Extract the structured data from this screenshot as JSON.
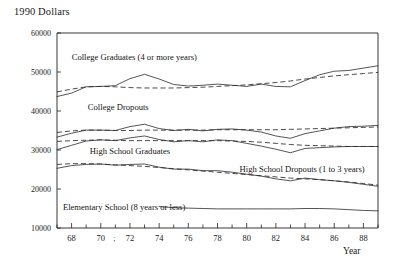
{
  "chart_data": {
    "type": "line",
    "title": "1990 Dollars",
    "xlabel": "Year",
    "ylabel": "",
    "xlim": [
      67,
      89
    ],
    "ylim": [
      10000,
      60000
    ],
    "grid": false,
    "legend_position": "inline-annotations",
    "ytick_labels": [
      "60000",
      "50000",
      "40000",
      "30000",
      "20000",
      "10000"
    ],
    "ytick_values": [
      60000,
      50000,
      40000,
      30000,
      20000,
      10000
    ],
    "xtick_labels": [
      "68",
      "70",
      "72",
      "74",
      "76",
      "78",
      "80",
      "82",
      "84",
      "86",
      "88"
    ],
    "xtick_values": [
      68,
      70,
      72,
      74,
      76,
      78,
      80,
      82,
      84,
      86,
      88
    ],
    "x_minor_ticks": [
      67,
      69,
      71,
      73,
      75,
      77,
      79,
      81,
      83,
      85,
      87,
      89
    ],
    "stray_mark": ";",
    "annotations": [
      {
        "text": "College Graduates (4 or more years)",
        "x": 72.3,
        "y": 53200
      },
      {
        "text": "College Dropouts",
        "x": 71.2,
        "y": 40300
      },
      {
        "text": "High School Graduates",
        "x": 72.0,
        "y": 29100
      },
      {
        "text": "High School Dropouts (1 to 3 years)",
        "x": 83.8,
        "y": 24300
      },
      {
        "text": "Elementary School (8 years or less)",
        "x": 71.6,
        "y": 14500
      }
    ],
    "series": [
      {
        "name": "College Graduates (4 or more years) - solid",
        "style": "solid",
        "x": [
          67,
          68,
          69,
          70,
          71,
          72,
          73,
          74,
          75,
          76,
          77,
          78,
          79,
          80,
          81,
          82,
          83,
          84,
          85,
          86,
          87,
          88,
          89
        ],
        "values": [
          43700,
          44600,
          46200,
          46300,
          46500,
          48300,
          49400,
          48200,
          46800,
          46400,
          46600,
          46900,
          46600,
          46300,
          46900,
          46300,
          46200,
          47800,
          49300,
          50200,
          50400,
          51000,
          51600
        ]
      },
      {
        "name": "College Graduates (4 or more years) - dashed",
        "style": "dashed",
        "x": [
          67,
          68,
          69,
          70,
          71,
          72,
          73,
          74,
          75,
          76,
          77,
          78,
          79,
          80,
          81,
          82,
          83,
          84,
          85,
          86,
          87,
          88,
          89
        ],
        "values": [
          44900,
          45600,
          46200,
          46300,
          46200,
          46000,
          45900,
          45900,
          45900,
          46000,
          46100,
          46300,
          46500,
          46700,
          47000,
          47300,
          47700,
          48200,
          48600,
          49000,
          49300,
          49600,
          49900
        ]
      },
      {
        "name": "College Dropouts - solid",
        "style": "solid",
        "x": [
          67,
          68,
          69,
          70,
          71,
          72,
          73,
          74,
          75,
          76,
          77,
          78,
          79,
          80,
          81,
          82,
          83,
          84,
          85,
          86,
          87,
          88,
          89
        ],
        "values": [
          33300,
          34300,
          35100,
          35100,
          35000,
          36000,
          36600,
          35500,
          35000,
          35300,
          34900,
          35300,
          35400,
          35100,
          34600,
          33600,
          33000,
          34200,
          34900,
          35600,
          36000,
          36100,
          36300
        ]
      },
      {
        "name": "College Dropouts - dashed",
        "style": "dashed",
        "x": [
          67,
          68,
          69,
          70,
          71,
          72,
          73,
          74,
          75,
          76,
          77,
          78,
          79,
          80,
          81,
          82,
          83,
          84,
          85,
          86,
          87,
          88,
          89
        ],
        "values": [
          34500,
          34900,
          35100,
          35100,
          35000,
          35000,
          35100,
          35100,
          35100,
          35100,
          35100,
          35200,
          35200,
          35200,
          35200,
          35200,
          35300,
          35400,
          35500,
          35600,
          35700,
          35800,
          35900
        ]
      },
      {
        "name": "High School Graduates - solid",
        "style": "solid",
        "x": [
          67,
          68,
          69,
          70,
          71,
          72,
          73,
          74,
          75,
          76,
          77,
          78,
          79,
          80,
          81,
          82,
          83,
          84,
          85,
          86,
          87,
          88,
          89
        ],
        "values": [
          30100,
          31200,
          32300,
          32600,
          32400,
          33100,
          33600,
          32700,
          32100,
          32400,
          32100,
          32600,
          32400,
          31700,
          31000,
          30200,
          29300,
          30400,
          30600,
          30800,
          30900,
          30900,
          30900
        ]
      },
      {
        "name": "High School Graduates - dashed",
        "style": "dashed",
        "x": [
          67,
          68,
          69,
          70,
          71,
          72,
          73,
          74,
          75,
          76,
          77,
          78,
          79,
          80,
          81,
          82,
          83,
          84,
          85,
          86,
          87,
          88,
          89
        ],
        "values": [
          32200,
          32400,
          32500,
          32600,
          32500,
          32400,
          32400,
          32400,
          32400,
          32400,
          32400,
          32400,
          32300,
          32200,
          32000,
          31700,
          31400,
          31200,
          31100,
          31000,
          30900,
          30900,
          30900
        ]
      },
      {
        "name": "High School Dropouts (1 to 3 years) - solid",
        "style": "solid",
        "x": [
          67,
          68,
          69,
          70,
          71,
          72,
          73,
          74,
          75,
          76,
          77,
          78,
          79,
          80,
          81,
          82,
          83,
          84,
          85,
          86,
          87,
          88,
          89
        ],
        "values": [
          25300,
          26000,
          26300,
          26400,
          26100,
          26300,
          26400,
          25600,
          25100,
          25100,
          24700,
          24700,
          24300,
          23800,
          23300,
          22600,
          22100,
          22800,
          22400,
          22100,
          21700,
          21200,
          20700
        ]
      },
      {
        "name": "High School Dropouts (1 to 3 years) - dashed",
        "style": "dashed",
        "x": [
          67,
          68,
          69,
          70,
          71,
          72,
          73,
          74,
          75,
          76,
          77,
          78,
          79,
          80,
          81,
          82,
          83,
          84,
          85,
          86,
          87,
          88,
          89
        ],
        "values": [
          26300,
          26500,
          26500,
          26400,
          26200,
          26000,
          25800,
          25500,
          25200,
          24900,
          24600,
          24300,
          24000,
          23700,
          23400,
          23100,
          22800,
          22600,
          22400,
          22100,
          21800,
          21400,
          21000
        ]
      },
      {
        "name": "Elementary School (8 years or less) - solid",
        "style": "solid",
        "x": [
          74,
          75,
          76,
          77,
          78,
          79,
          80,
          81,
          82,
          83,
          84,
          85,
          86,
          87,
          88,
          89
        ],
        "values": [
          15500,
          15200,
          15100,
          15000,
          14900,
          14900,
          14900,
          14900,
          14900,
          14900,
          15000,
          15000,
          14900,
          14700,
          14500,
          14400
        ]
      }
    ]
  }
}
